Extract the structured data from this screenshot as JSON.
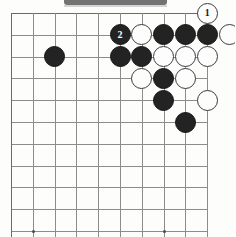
{
  "diagram": {
    "board": {
      "type": "go-board",
      "partial": true,
      "visible_columns": 10,
      "visible_rows": 11,
      "cell_size_px": 21.8,
      "origin_x_px": 11,
      "origin_y_px": 13,
      "grid_color": "#8c8c8c",
      "background_color": "#fdfdfc",
      "black_color": "#232323",
      "white_color": "#fdfdfd"
    },
    "star_points": [
      {
        "col": 1,
        "row": 10
      },
      {
        "col": 7,
        "row": 10
      }
    ],
    "stones": [
      {
        "id": "s01",
        "color": "black",
        "col": 2,
        "row": 2,
        "label": ""
      },
      {
        "id": "s02",
        "color": "black",
        "col": 5,
        "row": 1,
        "label": "2"
      },
      {
        "id": "s03",
        "color": "white",
        "col": 6,
        "row": 1,
        "label": ""
      },
      {
        "id": "s04",
        "color": "black",
        "col": 7,
        "row": 1,
        "label": ""
      },
      {
        "id": "s05",
        "color": "black",
        "col": 8,
        "row": 1,
        "label": ""
      },
      {
        "id": "s06",
        "color": "black",
        "col": 9,
        "row": 1,
        "label": ""
      },
      {
        "id": "s07",
        "color": "white",
        "col": 10,
        "row": 1,
        "label": ""
      },
      {
        "id": "s08",
        "color": "white",
        "col": 9,
        "row": 0,
        "label": "1"
      },
      {
        "id": "s09",
        "color": "black",
        "col": 5,
        "row": 2,
        "label": ""
      },
      {
        "id": "s10",
        "color": "black",
        "col": 6,
        "row": 2,
        "label": ""
      },
      {
        "id": "s11",
        "color": "white",
        "col": 7,
        "row": 2,
        "label": ""
      },
      {
        "id": "s12",
        "color": "white",
        "col": 8,
        "row": 2,
        "label": ""
      },
      {
        "id": "s13",
        "color": "white",
        "col": 9,
        "row": 2,
        "label": ""
      },
      {
        "id": "s14",
        "color": "white",
        "col": 6,
        "row": 3,
        "label": ""
      },
      {
        "id": "s15",
        "color": "black",
        "col": 7,
        "row": 3,
        "label": ""
      },
      {
        "id": "s16",
        "color": "white",
        "col": 8,
        "row": 3,
        "label": ""
      },
      {
        "id": "s17",
        "color": "black",
        "col": 7,
        "row": 4,
        "label": ""
      },
      {
        "id": "s18",
        "color": "white",
        "col": 9,
        "row": 4,
        "label": ""
      },
      {
        "id": "s19",
        "color": "black",
        "col": 8,
        "row": 5,
        "label": ""
      }
    ],
    "move_labels": [
      {
        "number": "1",
        "color": "white"
      },
      {
        "number": "2",
        "color": "black"
      }
    ],
    "header_bar": {
      "present": true,
      "color": "#5b5b5b"
    }
  }
}
